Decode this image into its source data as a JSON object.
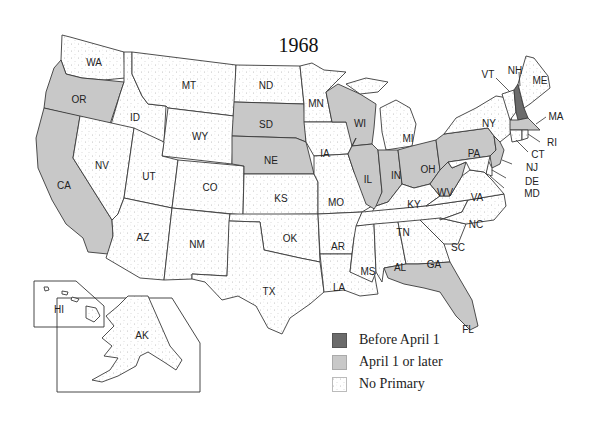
{
  "title": "1968",
  "colors": {
    "before_april_1": "#6b6b6b",
    "april_1_or_later": "#c8c8c8",
    "no_primary": "#ffffff",
    "dot": "#b5b5b5",
    "border": "#3a3a3a"
  },
  "legend": [
    {
      "label": "Before April 1",
      "category": "before_april_1"
    },
    {
      "label": "April 1 or later",
      "category": "april_1_or_later"
    },
    {
      "label": "No Primary",
      "category": "no_primary"
    }
  ],
  "states": {
    "before_april_1": [
      "NH"
    ],
    "april_1_or_later": [
      "OR",
      "CA",
      "SD",
      "NE",
      "WI",
      "IL",
      "IN",
      "OH",
      "WV",
      "PA",
      "NJ",
      "MA",
      "FL"
    ],
    "no_primary": [
      "WA",
      "ID",
      "MT",
      "WY",
      "NV",
      "UT",
      "CO",
      "AZ",
      "NM",
      "ND",
      "MN",
      "IA",
      "KS",
      "MO",
      "OK",
      "TX",
      "AR",
      "LA",
      "MS",
      "AL",
      "GA",
      "SC",
      "NC",
      "TN",
      "KY",
      "VA",
      "MI",
      "NY",
      "VT",
      "ME",
      "CT",
      "RI",
      "DE",
      "MD",
      "AK",
      "HI"
    ]
  },
  "labels": {
    "WA": "WA",
    "OR": "OR",
    "CA": "CA",
    "ID": "ID",
    "NV": "NV",
    "MT": "MT",
    "WY": "WY",
    "UT": "UT",
    "CO": "CO",
    "AZ": "AZ",
    "NM": "NM",
    "ND": "ND",
    "SD": "SD",
    "NE": "NE",
    "KS": "KS",
    "OK": "OK",
    "TX": "TX",
    "MN": "MN",
    "IA": "IA",
    "MO": "MO",
    "AR": "AR",
    "LA": "LA",
    "WI": "WI",
    "IL": "IL",
    "MI": "MI",
    "IN": "IN",
    "OH": "OH",
    "KY": "KY",
    "TN": "TN",
    "MS": "MS",
    "AL": "AL",
    "GA": "GA",
    "FL": "FL",
    "SC": "SC",
    "NC": "NC",
    "VA": "VA",
    "WV": "WV",
    "PA": "PA",
    "NY": "NY",
    "VT": "VT",
    "NH": "NH",
    "ME": "ME",
    "MA": "MA",
    "RI": "RI",
    "CT": "CT",
    "NJ": "NJ",
    "DE": "DE",
    "MD": "MD",
    "AK": "AK",
    "HI": "HI"
  }
}
